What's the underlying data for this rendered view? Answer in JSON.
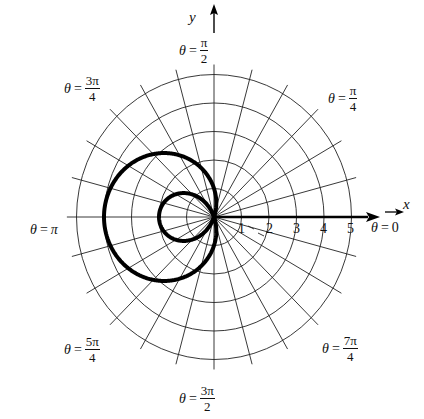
{
  "figure": {
    "type": "polar-graph",
    "curve": {
      "equation": "r = 1 - 3cos(theta)",
      "a": 1,
      "b": 3,
      "stroke": "#000000",
      "stroke_width": 4
    },
    "grid": {
      "circles": [
        1,
        2,
        3,
        4,
        5
      ],
      "radial_step_deg": 15,
      "stroke": "#222222"
    },
    "axes": {
      "x_label": "x",
      "y_label": "y",
      "radial_ticks": [
        "1",
        "2",
        "3",
        "4",
        "5"
      ]
    },
    "angle_labels": [
      {
        "id": "theta-0",
        "prefix": "θ",
        "eq": "=",
        "value": "0",
        "num": null,
        "den": null
      },
      {
        "id": "theta-pi-4",
        "prefix": "θ",
        "eq": "=",
        "value": null,
        "num": "π",
        "den": "4"
      },
      {
        "id": "theta-pi-2",
        "prefix": "θ",
        "eq": "=",
        "value": null,
        "num": "π",
        "den": "2"
      },
      {
        "id": "theta-3pi-4",
        "prefix": "θ",
        "eq": "=",
        "value": null,
        "num": "3π",
        "den": "4"
      },
      {
        "id": "theta-pi",
        "prefix": "θ",
        "eq": "=",
        "value": "π",
        "num": null,
        "den": null
      },
      {
        "id": "theta-5pi-4",
        "prefix": "θ",
        "eq": "=",
        "value": null,
        "num": "5π",
        "den": "4"
      },
      {
        "id": "theta-3pi-2",
        "prefix": "θ",
        "eq": "=",
        "value": null,
        "num": "3π",
        "den": "2"
      },
      {
        "id": "theta-7pi-4",
        "prefix": "θ",
        "eq": "=",
        "value": null,
        "num": "7π",
        "den": "4"
      }
    ]
  }
}
